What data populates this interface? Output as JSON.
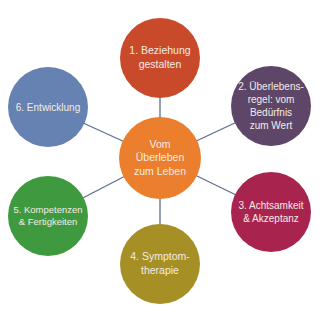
{
  "diagram": {
    "type": "hub-and-spoke",
    "center": {
      "label": "Vom\nÜberleben\nzum Leben",
      "color": "#ec7f2e"
    },
    "nodes": [
      {
        "label": "1. Beziehung\ngestalten",
        "color": "#c94a2a"
      },
      {
        "label": "2. Überlebens-\nregel: vom\nBedürfnis\nzum Wert",
        "color": "#5e4668"
      },
      {
        "label": "3. Achtsamkeit\n& Akzeptanz",
        "color": "#a8244f"
      },
      {
        "label": "4. Symptom-\ntherapie",
        "color": "#a68f25"
      },
      {
        "label": "5. Kompetenzen\n& Fertigkeiten",
        "color": "#3f9a3f"
      },
      {
        "label": "6. Entwicklung",
        "color": "#6582b2"
      }
    ],
    "connector_color": "#5c6f8c"
  }
}
